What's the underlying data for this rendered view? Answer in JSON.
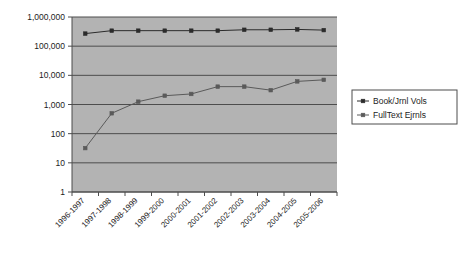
{
  "chart_data": {
    "type": "line",
    "title": "",
    "subtitle": "",
    "xlabel": "",
    "ylabel": "",
    "yscale": "log",
    "ylim": [
      1,
      1000000
    ],
    "grid": true,
    "legend_position": "right",
    "plot_background_color": "#b3b3b3",
    "page_background_color": "#ffffff",
    "gridline_color": "#4d4d4d",
    "axis_color": "#4d4d4d",
    "categories": [
      "1996-1997",
      "1997-1998",
      "1998-1999",
      "1999-2000",
      "2000-2001",
      "2001-2002",
      "2002-2003",
      "2003-2004",
      "2004-2005",
      "2005-2006"
    ],
    "ytick_labels": [
      "1",
      "10",
      "100",
      "1,000",
      "10,000",
      "100,000",
      "1,000,000"
    ],
    "ytick_values": [
      1,
      10,
      100,
      1000,
      10000,
      100000,
      1000000
    ],
    "series": [
      {
        "name": "Book/Jrnl Vols",
        "color": "#2b2b2b",
        "marker": "square",
        "values": [
          270000,
          340000,
          340000,
          340000,
          340000,
          340000,
          365000,
          365000,
          375000,
          355000
        ]
      },
      {
        "name": "FullText Ejrnls",
        "color": "#5a5a5a",
        "marker": "square",
        "values": [
          32,
          500,
          1250,
          2000,
          2300,
          4100,
          4100,
          3100,
          6200,
          7000
        ]
      }
    ]
  },
  "legend": {
    "entries": [
      {
        "label": "Book/Jrnl Vols"
      },
      {
        "label": "FullText Ejrnls"
      }
    ]
  }
}
